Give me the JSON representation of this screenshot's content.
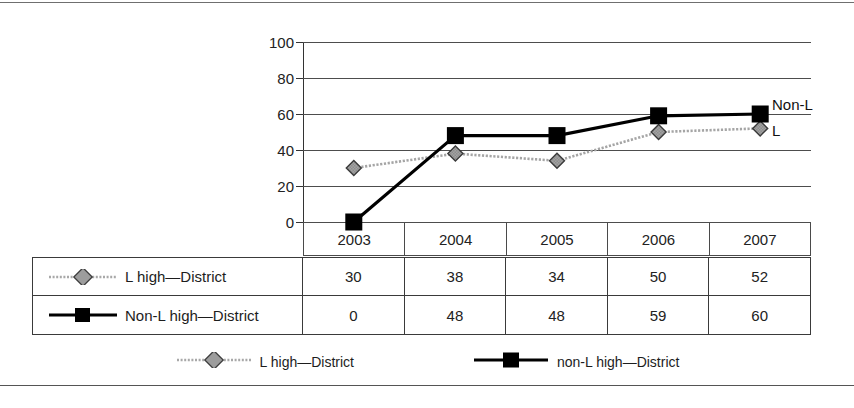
{
  "chart_data": {
    "type": "line",
    "title": "",
    "xlabel": "",
    "ylabel": "",
    "categories": [
      "2003",
      "2004",
      "2005",
      "2006",
      "2007"
    ],
    "ylim": [
      0,
      100
    ],
    "yticks": [
      0,
      20,
      40,
      60,
      80,
      100
    ],
    "grid": true,
    "legend_position": "bottom",
    "series": [
      {
        "name": "L high—District",
        "legend_name": "L high—District",
        "edge_label": "L",
        "marker": "diamond",
        "color": "#9a9a9a",
        "values": [
          30,
          38,
          34,
          50,
          52
        ]
      },
      {
        "name": "Non-L high—District",
        "legend_name": "non-L high—District",
        "edge_label": "Non-L",
        "marker": "square",
        "color": "#000000",
        "values": [
          0,
          48,
          48,
          59,
          60
        ]
      }
    ],
    "annotations": [
      "Non-L",
      "L"
    ]
  },
  "axis": {
    "y_tick_labels": [
      "100",
      "80",
      "60",
      "40",
      "20",
      "0"
    ]
  },
  "year_header": {
    "cells": [
      "2003",
      "2004",
      "2005",
      "2006",
      "2007"
    ]
  },
  "data_table": {
    "rows": [
      {
        "label": "L high—District",
        "marker": "diamond",
        "values": [
          "30",
          "38",
          "34",
          "50",
          "52"
        ]
      },
      {
        "label": "Non-L high—District",
        "marker": "square",
        "values": [
          "0",
          "48",
          "48",
          "59",
          "60"
        ]
      }
    ]
  },
  "legend": {
    "items": [
      {
        "label": "L high—District",
        "marker": "diamond"
      },
      {
        "label": "non-L high—District",
        "marker": "square"
      }
    ]
  },
  "colors": {
    "series_gray": "#9a9a9a",
    "series_black": "#000000",
    "gridline": "#4d4d4d",
    "border": "#3a3a3a"
  }
}
